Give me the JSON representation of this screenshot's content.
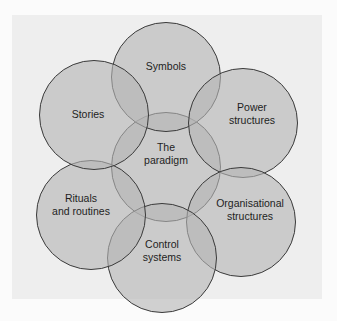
{
  "diagram": {
    "type": "cultural-web-venn",
    "center": {
      "id": "paradigm",
      "label_lines": [
        "The",
        "paradigm"
      ]
    },
    "elements": [
      {
        "id": "symbols",
        "label_lines": [
          "Symbols"
        ]
      },
      {
        "id": "power",
        "label_lines": [
          "Power",
          "structures"
        ]
      },
      {
        "id": "organisational",
        "label_lines": [
          "Organisational",
          "structures"
        ]
      },
      {
        "id": "control",
        "label_lines": [
          "Control",
          "systems"
        ]
      },
      {
        "id": "rituals",
        "label_lines": [
          "Rituals",
          "and routines"
        ]
      },
      {
        "id": "stories",
        "label_lines": [
          "Stories"
        ]
      }
    ],
    "colors": {
      "panel": "#eeeeee",
      "circle_fill": "#b4b4b4",
      "circle_stroke": "#3a3a3a",
      "text": "#1e1e1e"
    }
  }
}
